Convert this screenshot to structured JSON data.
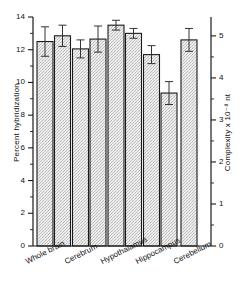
{
  "chart_data": {
    "type": "bar",
    "title": "",
    "xlabel": "",
    "ylabel": "Percent hybridization",
    "ylabel_right": "Complexity x 10⁻⁸ nt",
    "ylim": [
      0,
      14
    ],
    "yticks": [
      0,
      2,
      4,
      6,
      8,
      10,
      12,
      14
    ],
    "ylim_right": [
      0,
      5.45
    ],
    "yticks_right": [
      0,
      1,
      2,
      3,
      4,
      5
    ],
    "ytick_minor_right": [
      0.5,
      1.5,
      2.5,
      3.5,
      4.5
    ],
    "grid": false,
    "legend": "none",
    "categories": [
      "Whole brain",
      "Cerebrum",
      "Hypothalamus",
      "Hippocampus",
      "Cerebellum"
    ],
    "series": [
      {
        "name": "bar 1",
        "values": [
          12.5,
          12.05,
          13.5,
          11.7,
          12.6
        ],
        "errors": [
          0.9,
          0.55,
          0.3,
          0.55,
          0.7
        ]
      },
      {
        "name": "bar 2",
        "values": [
          12.85,
          12.65,
          13.0,
          9.35,
          null
        ],
        "errors": [
          0.65,
          0.8,
          0.3,
          0.7,
          null
        ]
      }
    ],
    "bar_fill": "#e8e8e8",
    "bar_edge": "#1a1a1a",
    "bar_pattern": "stipple",
    "axis_color": "#1a1a1a"
  },
  "ticks_left": [
    "0",
    "2",
    "4",
    "6",
    "8",
    "10",
    "12",
    "14"
  ],
  "ticks_right": [
    "0",
    "1",
    "2",
    "3",
    "4",
    "5"
  ],
  "labels": {
    "y_left": "Percent hybridization",
    "y_right": "Complexity x 10⁻⁸ nt",
    "cat0": "Whole brain",
    "cat1": "Cerebrum",
    "cat2": "Hypothalamus",
    "cat3": "Hippocampus",
    "cat4": "Cerebellum"
  }
}
